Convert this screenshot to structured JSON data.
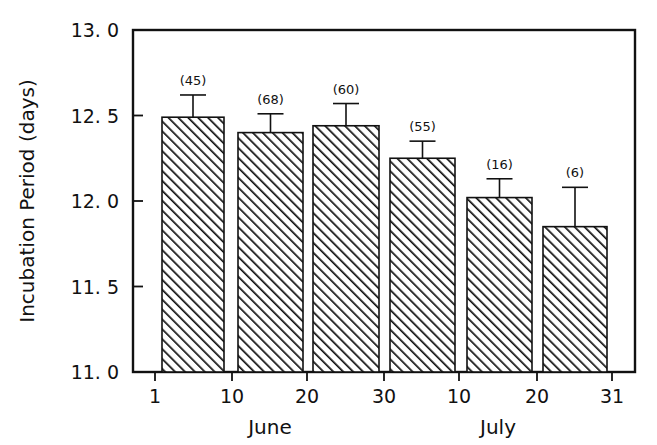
{
  "chart_data": {
    "type": "bar",
    "title": "",
    "xlabel": "",
    "ylabel": "Incubation Period (days)",
    "ylim": [
      11.0,
      13.0
    ],
    "yticks": [
      "11. 0",
      "11. 5",
      "12. 0",
      "12. 5",
      "13. 0"
    ],
    "ytick_values": [
      11.0,
      11.5,
      12.0,
      12.5,
      13.0
    ],
    "xticks": [
      "1",
      "10",
      "20",
      "30",
      "10",
      "20",
      "31"
    ],
    "xtick_positions": [
      155,
      232,
      307,
      384,
      459,
      537,
      612
    ],
    "xgroups": [
      {
        "label": "June",
        "center": 270
      },
      {
        "label": "July",
        "center": 498
      }
    ],
    "grid": false,
    "legend": null,
    "bar_fill": "diagonal-hatch",
    "bar_edge_color": "#111111",
    "categories": [
      "Jun 1-10",
      "Jun 10-20",
      "Jun 20-30",
      "Jun 30-Jul 10",
      "Jul 10-20",
      "Jul 20-31"
    ],
    "values": [
      12.49,
      12.4,
      12.44,
      12.25,
      12.02,
      11.85
    ],
    "error_upper": [
      12.62,
      12.51,
      12.57,
      12.35,
      12.13,
      12.08
    ],
    "sample_labels": [
      "(45)",
      "(68)",
      "(60)",
      "(55)",
      "(16)",
      "(6)"
    ],
    "sample_sizes": [
      45,
      68,
      60,
      55,
      16,
      6
    ],
    "bar_pixel_spans": [
      {
        "x0": 162,
        "x1": 224
      },
      {
        "x0": 238,
        "x1": 303
      },
      {
        "x0": 313,
        "x1": 379
      },
      {
        "x0": 390,
        "x1": 455
      },
      {
        "x0": 467,
        "x1": 532
      },
      {
        "x0": 543,
        "x1": 607
      }
    ]
  }
}
